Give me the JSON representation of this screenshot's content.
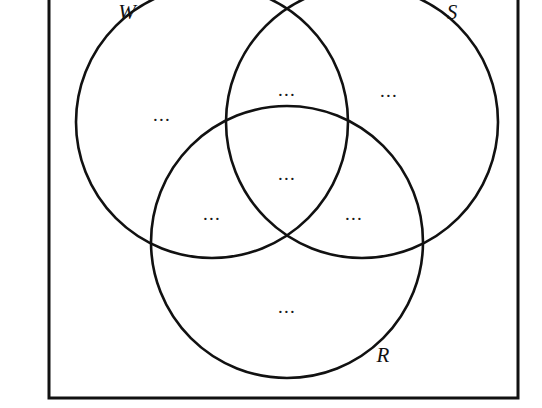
{
  "figure": {
    "type": "venn-diagram-3-set",
    "background_color": "#ffffff",
    "stroke_color": "#111111",
    "title": ""
  },
  "frame": {
    "name": "universal-set-rectangle",
    "x": 49,
    "y": -18,
    "width": 469,
    "height": 416,
    "stroke_width": 3
  },
  "sets": [
    {
      "id": "W",
      "label": "W",
      "label_x": 127,
      "label_y": 19,
      "cx": 212,
      "cy": 122,
      "r": 136
    },
    {
      "id": "S",
      "label": "S",
      "label_x": 452,
      "label_y": 19,
      "cx": 362,
      "cy": 122,
      "r": 136
    },
    {
      "id": "R",
      "label": "R",
      "label_x": 383,
      "label_y": 362,
      "cx": 287,
      "cy": 242,
      "r": 136
    }
  ],
  "regions": [
    {
      "id": "W-only",
      "label": "...",
      "x": 162,
      "y": 121,
      "sets": "W"
    },
    {
      "id": "W-and-S",
      "label": "...",
      "x": 287,
      "y": 96,
      "sets": "W,S"
    },
    {
      "id": "S-only",
      "label": "...",
      "x": 389,
      "y": 97,
      "sets": "S"
    },
    {
      "id": "W-S-R",
      "label": "...",
      "x": 287,
      "y": 180,
      "sets": "W,S,R"
    },
    {
      "id": "W-and-R",
      "label": "...",
      "x": 212,
      "y": 220,
      "sets": "W,R"
    },
    {
      "id": "S-and-R",
      "label": "...",
      "x": 354,
      "y": 220,
      "sets": "S,R"
    },
    {
      "id": "R-only",
      "label": "...",
      "x": 287,
      "y": 313,
      "sets": "R"
    }
  ]
}
